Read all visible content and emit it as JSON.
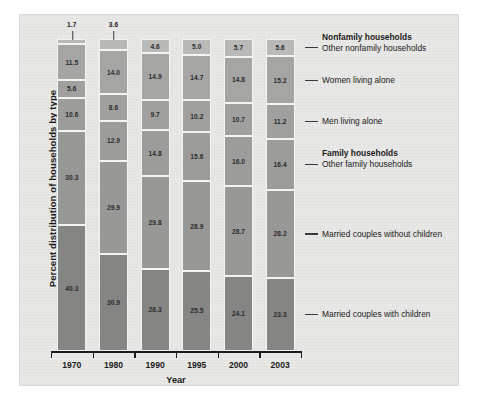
{
  "figure": {
    "ylabel": "Percent distribution of households by type",
    "xlabel": "Year"
  },
  "legend": [
    {
      "label": "Nonfamily households",
      "type": "heading"
    },
    {
      "label": "Other nonfamily households",
      "type": "item"
    },
    {
      "label": "Women living alone",
      "type": "item"
    },
    {
      "label": "Men living alone",
      "type": "item"
    },
    {
      "label": "Family households",
      "type": "heading"
    },
    {
      "label": "Other family households",
      "type": "item"
    },
    {
      "label": "Married couples without children",
      "type": "item"
    },
    {
      "label": "Married couples with children",
      "type": "item"
    }
  ],
  "chart_data": {
    "type": "bar",
    "subtype": "stacked-100-percent",
    "title": "",
    "xlabel": "Year",
    "ylabel": "Percent distribution of households by type",
    "ylim": [
      0,
      100
    ],
    "grid": false,
    "legend_position": "right",
    "categories": [
      "1970",
      "1980",
      "1990",
      "1995",
      "2000",
      "2003"
    ],
    "series": [
      {
        "name": "Other nonfamily households",
        "color": "#b9b9b7",
        "values": [
          1.7,
          3.6,
          4.6,
          5.0,
          5.7,
          5.6
        ]
      },
      {
        "name": "Women living alone",
        "color": "#a5a5a3",
        "values": [
          11.5,
          14.0,
          14.9,
          14.7,
          14.8,
          15.2
        ]
      },
      {
        "name": "Men living alone",
        "color": "#a0a09e",
        "values": [
          5.6,
          8.6,
          9.7,
          10.2,
          10.7,
          11.2
        ]
      },
      {
        "name": "Other family households",
        "color": "#9c9c9a",
        "values": [
          10.6,
          12.9,
          14.8,
          15.6,
          16.0,
          16.4
        ]
      },
      {
        "name": "Married couples without children",
        "color": "#989896",
        "values": [
          30.3,
          29.9,
          29.8,
          28.9,
          28.7,
          28.2
        ]
      },
      {
        "name": "Married couples with children",
        "color": "#858583",
        "values": [
          40.3,
          30.9,
          26.3,
          25.5,
          24.1,
          23.3
        ]
      }
    ],
    "value_label_outside": [
      {
        "category": "1970",
        "series": "Other nonfamily households",
        "value": 1.7
      },
      {
        "category": "1980",
        "series": "Other nonfamily households",
        "value": 3.6
      }
    ]
  }
}
